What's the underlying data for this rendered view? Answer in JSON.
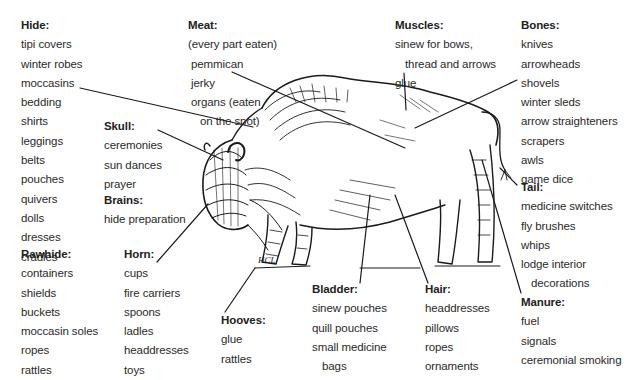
{
  "diagram": {
    "groups": [
      {
        "id": "hide",
        "title": "Hide:",
        "items": [
          "tipi covers",
          "winter robes",
          "moccasins",
          "bedding",
          "shirts",
          "leggings",
          "belts",
          "pouches",
          "quivers",
          "dolls",
          "dresses",
          "cradles"
        ]
      },
      {
        "id": "meat",
        "title": "Meat:",
        "items": [
          "(every part eaten)",
          "pemmican",
          "jerky",
          "organs (eaten",
          "on the spot)"
        ]
      },
      {
        "id": "muscles",
        "title": "Muscles:",
        "items": [
          "sinew for bows,",
          "thread and arrows",
          "glue"
        ]
      },
      {
        "id": "bones",
        "title": "Bones:",
        "items": [
          "knives",
          "arrowheads",
          "shovels",
          "winter sleds",
          "arrow straighteners",
          "scrapers",
          "awls",
          "game dice"
        ]
      },
      {
        "id": "skull",
        "title": "Skull:",
        "items": [
          "ceremonies",
          "sun dances",
          "prayer"
        ]
      },
      {
        "id": "brains",
        "title": "Brains:",
        "items": [
          "hide preparation"
        ]
      },
      {
        "id": "tail",
        "title": "Tail:",
        "items": [
          "medicine switches",
          "fly brushes",
          "whips",
          "lodge interior",
          "decorations"
        ]
      },
      {
        "id": "rawhide",
        "title": "Rawhide:",
        "items": [
          "containers",
          "shields",
          "buckets",
          "moccasin soles",
          "ropes",
          "rattles"
        ]
      },
      {
        "id": "horn",
        "title": "Horn:",
        "items": [
          "cups",
          "fire carriers",
          "spoons",
          "ladles",
          "headdresses",
          "toys"
        ]
      },
      {
        "id": "hooves",
        "title": "Hooves:",
        "items": [
          "glue",
          "rattles"
        ]
      },
      {
        "id": "bladder",
        "title": "Bladder:",
        "items": [
          "sinew pouches",
          "quill pouches",
          "small medicine",
          "bags"
        ]
      },
      {
        "id": "hair",
        "title": "Hair:",
        "items": [
          "headdresses",
          "pillows",
          "ropes",
          "ornaments"
        ]
      },
      {
        "id": "manure",
        "title": "Manure:",
        "items": [
          "fuel",
          "signals",
          "ceremonial smoking"
        ]
      }
    ],
    "signature": "HCL"
  }
}
